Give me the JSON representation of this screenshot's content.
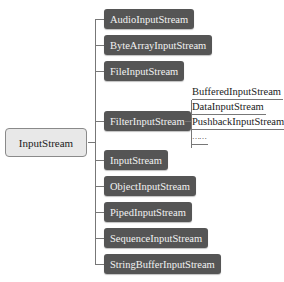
{
  "diagram": {
    "root": {
      "label": "InputStream"
    },
    "children": [
      {
        "label": "AudioInputStream"
      },
      {
        "label": "ByteArrayInputStream"
      },
      {
        "label": "FileInputStream"
      },
      {
        "label": "FilterInputStream",
        "subclasses": [
          {
            "label": "BufferedInputStream"
          },
          {
            "label": "DataInputStream"
          },
          {
            "label": "PushbackInputStream"
          },
          {
            "label": "……"
          }
        ]
      },
      {
        "label": "InputStream"
      },
      {
        "label": "ObjectInputStream"
      },
      {
        "label": "PipedInputStream"
      },
      {
        "label": "SequenceInputStream"
      },
      {
        "label": "StringBufferInputStream"
      }
    ]
  },
  "colors": {
    "child_fill": "#555555",
    "root_fill": "#e8e8e8",
    "line": "#777777"
  }
}
